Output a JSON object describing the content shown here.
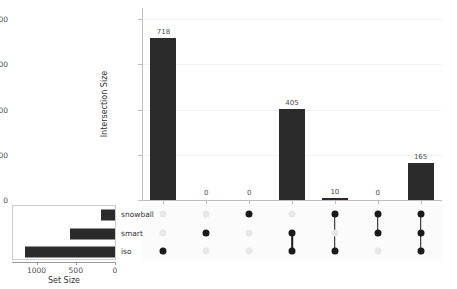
{
  "chart_data": {
    "type": "bar",
    "plot_kind": "upset",
    "title": "",
    "ylabel": "Intersection Size",
    "xlabel": "",
    "ylim": [
      0,
      850
    ],
    "yticks": [
      0,
      200,
      400,
      600,
      800
    ],
    "ytick_labels": [
      "0",
      "200",
      "400",
      "600",
      "800"
    ],
    "grid": true,
    "sets": [
      "snowball",
      "smart",
      "iso"
    ],
    "set_sizes": {
      "labels": [
        "snowball",
        "smart",
        "iso"
      ],
      "values": [
        175,
        580,
        1145
      ],
      "axis_label": "Set Size",
      "xticks": [
        1000,
        500,
        0
      ],
      "xtick_labels": [
        "1000",
        "500",
        "0"
      ],
      "xlim": [
        1300,
        0
      ],
      "reversed": true
    },
    "categories": [
      "iso",
      "smart",
      "snowball",
      "smart & iso",
      "snowball & iso",
      "snowball & smart",
      "snowball & smart & iso"
    ],
    "values": [
      718,
      0,
      0,
      405,
      10,
      0,
      165
    ],
    "bar_labels": [
      "718",
      "0",
      "0",
      "405",
      "10",
      "0",
      "165"
    ],
    "memberships": [
      [
        false,
        false,
        true
      ],
      [
        false,
        true,
        false
      ],
      [
        true,
        false,
        false
      ],
      [
        false,
        true,
        true
      ],
      [
        true,
        false,
        true
      ],
      [
        true,
        true,
        false
      ],
      [
        true,
        true,
        true
      ]
    ],
    "colors": {
      "bar": "#2b2b2b",
      "dot_on": "#1a1a1a",
      "dot_off": "#e8e8e8",
      "grid": "#f2f2f2",
      "axis": "#bdbdbd",
      "matrix_background": "#fbfbfb"
    }
  }
}
